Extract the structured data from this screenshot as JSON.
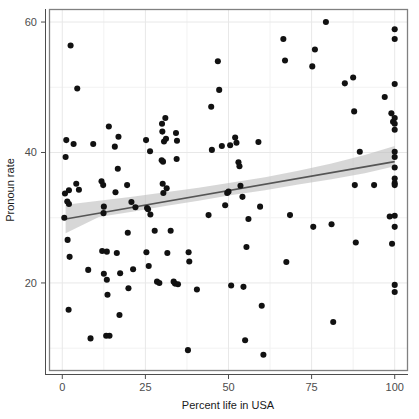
{
  "chart_data": {
    "type": "scatter",
    "title": "",
    "subtitle": "",
    "xlabel": "Percent life in USA",
    "ylabel": "Pronoun rate",
    "xlim": [
      -4,
      104
    ],
    "ylim": [
      6.5,
      62
    ],
    "xticks": [
      0,
      25,
      50,
      75,
      100
    ],
    "xticklabels": [
      "0",
      "25",
      "50",
      "75",
      "100"
    ],
    "yticks": [
      20,
      40,
      60
    ],
    "yticklabels": [
      "20",
      "40",
      "60"
    ],
    "grid": true,
    "grid_major_color": "#e8e8e8",
    "grid_minor_color": "#f2f2f2",
    "panel_border_color": "#808080",
    "point_color": "#111111",
    "point_size": 4.4,
    "legend": null,
    "legend_position": "none",
    "annotations": [],
    "fit": {
      "type": "linear-regression",
      "line_color": "#555555",
      "band_color": "#bfbfbf",
      "band_opacity": 0.62,
      "x_start": 1,
      "x_end": 100,
      "y_start": 29.8,
      "y_end": 38.6,
      "ci_lower": [
        27.6,
        38.0
      ],
      "ci_upper": [
        32.0,
        42.0
      ],
      "band_lower": [
        27.6,
        30.1,
        30.9,
        31.8,
        32.6,
        33.5,
        34.2,
        35.1,
        35.9,
        36.8,
        37.9
      ],
      "band_upper": [
        32.0,
        32.6,
        33.2,
        33.9,
        34.6,
        35.4,
        36.2,
        37.2,
        38.3,
        39.6,
        41.0
      ],
      "band_x": [
        1,
        11,
        21,
        31,
        41,
        51,
        61,
        71,
        81,
        91,
        100
      ]
    },
    "points": [
      [
        2.5,
        56.4
      ],
      [
        4.5,
        49.8
      ],
      [
        1.2,
        41.9
      ],
      [
        1.0,
        39.3
      ],
      [
        3.4,
        41.3
      ],
      [
        0.8,
        33.7
      ],
      [
        2.0,
        34.2
      ],
      [
        1.5,
        32.5
      ],
      [
        2.0,
        32.1
      ],
      [
        0.6,
        30.0
      ],
      [
        1.6,
        26.6
      ],
      [
        2.2,
        24.0
      ],
      [
        1.9,
        15.9
      ],
      [
        4.2,
        35.2
      ],
      [
        5.0,
        34.3
      ],
      [
        7.8,
        22.0
      ],
      [
        8.5,
        11.5
      ],
      [
        9.3,
        41.3
      ],
      [
        11.8,
        35.6
      ],
      [
        12.3,
        35.0
      ],
      [
        12.5,
        31.7
      ],
      [
        12.4,
        30.7
      ],
      [
        12.0,
        24.9
      ],
      [
        13.4,
        20.5
      ],
      [
        12.5,
        21.4
      ],
      [
        13.4,
        24.8
      ],
      [
        13.2,
        11.9
      ],
      [
        14.2,
        11.9
      ],
      [
        13.6,
        18.2
      ],
      [
        14.0,
        44.0
      ],
      [
        15.8,
        40.9
      ],
      [
        16.0,
        33.9
      ],
      [
        16.7,
        37.5
      ],
      [
        16.9,
        42.4
      ],
      [
        16.4,
        24.6
      ],
      [
        17.4,
        21.5
      ],
      [
        17.2,
        15.1
      ],
      [
        19.5,
        35.0
      ],
      [
        19.7,
        27.7
      ],
      [
        19.9,
        19.2
      ],
      [
        20.8,
        32.4
      ],
      [
        21.3,
        22.1
      ],
      [
        22.0,
        31.6
      ],
      [
        25.2,
        41.9
      ],
      [
        25.5,
        31.5
      ],
      [
        25.8,
        31.3
      ],
      [
        25.3,
        24.7
      ],
      [
        26.0,
        22.6
      ],
      [
        26.4,
        40.2
      ],
      [
        26.5,
        30.5
      ],
      [
        27.8,
        28.0
      ],
      [
        28.5,
        20.2
      ],
      [
        29.2,
        20.0
      ],
      [
        30.0,
        44.4
      ],
      [
        30.1,
        43.2
      ],
      [
        29.9,
        38.8
      ],
      [
        30.3,
        38.6
      ],
      [
        30.2,
        35.2
      ],
      [
        30.6,
        41.7
      ],
      [
        30.4,
        33.8
      ],
      [
        31.0,
        45.3
      ],
      [
        31.2,
        42.1
      ],
      [
        31.4,
        34.5
      ],
      [
        31.6,
        24.6
      ],
      [
        32.6,
        28.0
      ],
      [
        33.5,
        20.2
      ],
      [
        33.9,
        19.9
      ],
      [
        34.2,
        43.0
      ],
      [
        34.5,
        41.8
      ],
      [
        34.4,
        39.0
      ],
      [
        34.8,
        19.8
      ],
      [
        37.8,
        9.7
      ],
      [
        38.0,
        24.7
      ],
      [
        38.2,
        23.3
      ],
      [
        40.5,
        19.0
      ],
      [
        44.0,
        30.4
      ],
      [
        44.8,
        47.0
      ],
      [
        45.0,
        40.4
      ],
      [
        46.8,
        54.0
      ],
      [
        47.2,
        49.6
      ],
      [
        48.0,
        41.0
      ],
      [
        49.0,
        31.9
      ],
      [
        49.6,
        33.8
      ],
      [
        50.0,
        34.0
      ],
      [
        50.5,
        41.1
      ],
      [
        50.8,
        19.6
      ],
      [
        52.0,
        42.3
      ],
      [
        52.4,
        41.5
      ],
      [
        53.0,
        38.5
      ],
      [
        53.3,
        37.9
      ],
      [
        53.6,
        34.9
      ],
      [
        54.2,
        33.2
      ],
      [
        54.5,
        19.4
      ],
      [
        55.0,
        11.2
      ],
      [
        55.4,
        25.5
      ],
      [
        56.0,
        29.8
      ],
      [
        59.0,
        41.6
      ],
      [
        59.5,
        31.7
      ],
      [
        60.0,
        16.5
      ],
      [
        60.5,
        9.0
      ],
      [
        66.5,
        57.4
      ],
      [
        67.0,
        54.1
      ],
      [
        67.4,
        23.2
      ],
      [
        68.5,
        30.4
      ],
      [
        75.5,
        28.6
      ],
      [
        76.0,
        55.8
      ],
      [
        75.2,
        53.2
      ],
      [
        79.3,
        60.0
      ],
      [
        81.0,
        29.0
      ],
      [
        81.5,
        14.0
      ],
      [
        85.0,
        50.6
      ],
      [
        87.5,
        51.5
      ],
      [
        87.8,
        46.3
      ],
      [
        88.0,
        35.0
      ],
      [
        88.3,
        26.2
      ],
      [
        89.5,
        40.1
      ],
      [
        93.8,
        35.0
      ],
      [
        97.0,
        48.5
      ],
      [
        98.5,
        30.2
      ],
      [
        99.0,
        46.0
      ],
      [
        99.5,
        44.7
      ],
      [
        99.2,
        26.0
      ],
      [
        100.0,
        58.9
      ],
      [
        100.0,
        57.4
      ],
      [
        100.0,
        50.5
      ],
      [
        100.0,
        45.3
      ],
      [
        100.0,
        44.4
      ],
      [
        100.0,
        43.5
      ],
      [
        100.0,
        40.1
      ],
      [
        100.0,
        39.3
      ],
      [
        100.0,
        37.7
      ],
      [
        100.0,
        36.0
      ],
      [
        100.0,
        35.3
      ],
      [
        100.0,
        35.0
      ],
      [
        100.0,
        30.3
      ],
      [
        100.0,
        28.6
      ],
      [
        100.0,
        19.7
      ],
      [
        100.0,
        18.6
      ]
    ]
  }
}
